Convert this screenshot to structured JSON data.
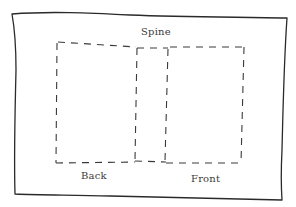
{
  "diagram": {
    "labels": {
      "spine": "Spine",
      "back": "Back",
      "front": "Front"
    },
    "colors": {
      "ink": "#2a2a2a",
      "paper": "#ffffff"
    },
    "panels": [
      "Back",
      "Spine",
      "Front"
    ]
  }
}
